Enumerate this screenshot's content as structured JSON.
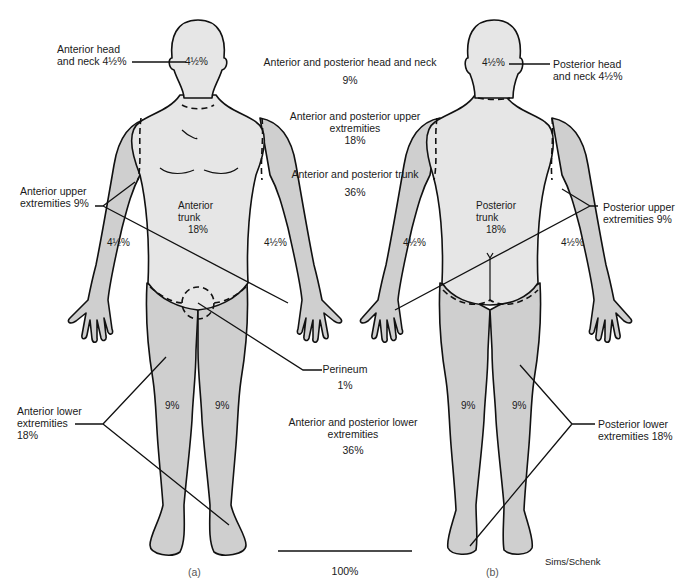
{
  "colors": {
    "trunk_fill": "#e6e6e6",
    "limb_fill": "#cfcfcf",
    "outline": "#111111",
    "background": "#ffffff"
  },
  "anterior": {
    "caption": "(a)",
    "head_label_line1": "Anterior head",
    "head_label_line2": "and neck 4½%",
    "head_value": "4½%",
    "upper_label_line1": "Anterior upper",
    "upper_label_line2": "extremities 9%",
    "trunk_line1": "Anterior",
    "trunk_line2": "trunk",
    "trunk_value": "18%",
    "left_arm_value": "4½%",
    "right_arm_value": "4½%",
    "left_leg_value": "9%",
    "right_leg_value": "9%",
    "lower_label_line1": "Anterior lower",
    "lower_label_line2": "extremities",
    "lower_label_line3": "18%"
  },
  "posterior": {
    "caption": "(b)",
    "head_label_line1": "Posterior head",
    "head_label_line2": "and neck 4½%",
    "head_value": "4½%",
    "upper_label_line1": "Posterior upper",
    "upper_label_line2": "extremities 9%",
    "trunk_line1": "Posterior",
    "trunk_line2": "trunk",
    "trunk_value": "18%",
    "left_arm_value": "4½%",
    "right_arm_value": "4½%",
    "left_leg_value": "9%",
    "right_leg_value": "9%",
    "lower_label_line1": "Posterior lower",
    "lower_label_line2": "extremities 18%"
  },
  "summary": {
    "head_neck_label": "Anterior and posterior head and neck",
    "head_neck_value": "9%",
    "upper_label_line1": "Anterior and posterior upper",
    "upper_label_line2": "extremities",
    "upper_value": "18%",
    "trunk_label": "Anterior and posterior trunk",
    "trunk_value": "36%",
    "perineum_label": "Perineum",
    "perineum_value": "1%",
    "lower_label_line1": "Anterior and posterior lower",
    "lower_label_line2": "extremities",
    "lower_value": "36%",
    "total_value": "100%"
  },
  "credit": "Sims/Schenk"
}
